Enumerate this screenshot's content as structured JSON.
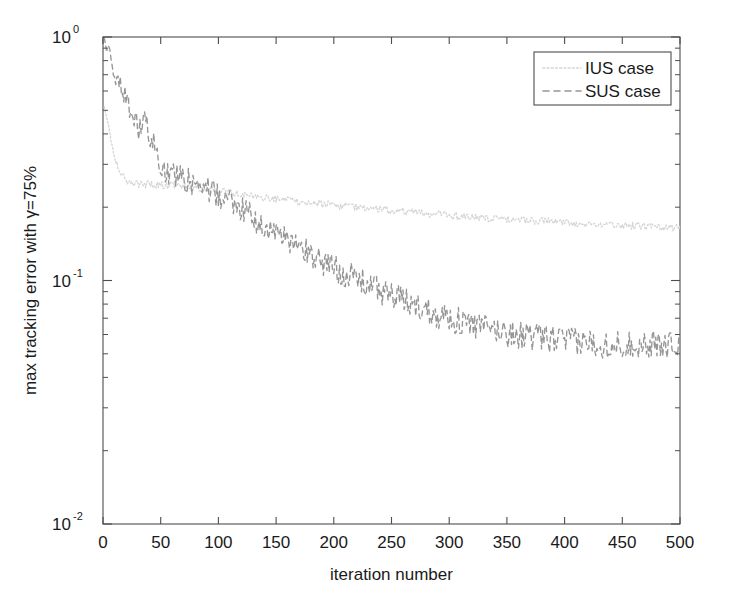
{
  "figure": {
    "background_color": "#ffffff",
    "axes_color": "#4d4d4d",
    "text_color": "#1a1a1a"
  },
  "axes": {
    "x_title": "iteration number",
    "y_title_parts": {
      "prefix": "max tracking error with ",
      "gamma": "γ",
      "suffix": "=75%"
    },
    "y_title_full": "max tracking error with γ=75%",
    "x_ticks": [
      "0",
      "50",
      "100",
      "150",
      "200",
      "250",
      "300",
      "350",
      "400",
      "450",
      "500"
    ],
    "x_tick_values": [
      0,
      50,
      100,
      150,
      200,
      250,
      300,
      350,
      400,
      450,
      500
    ],
    "y_ticks": [
      {
        "mantissa": "10",
        "exponent": "0",
        "value": 1
      },
      {
        "mantissa": "10",
        "exponent": "-1",
        "value": 0.1
      },
      {
        "mantissa": "10",
        "exponent": "-2",
        "value": 0.01
      }
    ]
  },
  "legend": {
    "position": "top-right",
    "entries": [
      {
        "label": "IUS case",
        "style": "dotted",
        "color": "#d5d5d5"
      },
      {
        "label": "SUS case",
        "style": "dashed",
        "color": "#969696"
      }
    ]
  },
  "chart_data": {
    "type": "line",
    "title": "",
    "xlabel": "iteration number",
    "ylabel": "max tracking error with γ=75%",
    "xlim": [
      0,
      500
    ],
    "ylim": [
      0.01,
      1
    ],
    "yscale": "log",
    "xscale": "linear",
    "grid": false,
    "legend_position": "upper right",
    "x": [
      1,
      6,
      11,
      16,
      21,
      26,
      31,
      36,
      41,
      46,
      51,
      56,
      61,
      66,
      71,
      76,
      81,
      86,
      91,
      96,
      101,
      106,
      111,
      116,
      121,
      126,
      131,
      136,
      141,
      146,
      151,
      156,
      161,
      166,
      171,
      176,
      181,
      186,
      191,
      196,
      201,
      206,
      211,
      216,
      221,
      226,
      231,
      236,
      241,
      246,
      251,
      256,
      261,
      266,
      271,
      276,
      281,
      286,
      291,
      296,
      301,
      306,
      311,
      316,
      321,
      326,
      331,
      336,
      341,
      346,
      351,
      356,
      361,
      366,
      371,
      376,
      381,
      386,
      391,
      396,
      401,
      406,
      411,
      416,
      421,
      426,
      431,
      436,
      441,
      446,
      451,
      456,
      461,
      466,
      471,
      476,
      481,
      486,
      491,
      496,
      500
    ],
    "series": [
      {
        "name": "IUS case",
        "style": "dotted",
        "color": "#d5d5d5",
        "values": [
          0.52,
          0.4,
          0.31,
          0.27,
          0.255,
          0.252,
          0.25,
          0.249,
          0.248,
          0.248,
          0.247,
          0.246,
          0.246,
          0.245,
          0.244,
          0.243,
          0.242,
          0.24,
          0.238,
          0.236,
          0.234,
          0.231,
          0.229,
          0.227,
          0.225,
          0.223,
          0.222,
          0.22,
          0.219,
          0.217,
          0.216,
          0.214,
          0.213,
          0.212,
          0.21,
          0.209,
          0.208,
          0.207,
          0.206,
          0.205,
          0.204,
          0.203,
          0.202,
          0.201,
          0.2,
          0.199,
          0.198,
          0.197,
          0.196,
          0.195,
          0.194,
          0.193,
          0.192,
          0.191,
          0.19,
          0.189,
          0.188,
          0.188,
          0.187,
          0.186,
          0.185,
          0.184,
          0.184,
          0.183,
          0.182,
          0.182,
          0.181,
          0.18,
          0.18,
          0.179,
          0.178,
          0.178,
          0.177,
          0.177,
          0.176,
          0.176,
          0.175,
          0.175,
          0.174,
          0.174,
          0.173,
          0.173,
          0.172,
          0.172,
          0.171,
          0.171,
          0.17,
          0.17,
          0.17,
          0.169,
          0.169,
          0.168,
          0.168,
          0.168,
          0.167,
          0.167,
          0.166,
          0.166,
          0.166,
          0.165,
          0.165
        ],
        "noise_amplitude": 0.035
      },
      {
        "name": "SUS case",
        "style": "dashed",
        "color": "#969696",
        "values": [
          0.98,
          0.8,
          0.68,
          0.62,
          0.55,
          0.46,
          0.42,
          0.44,
          0.4,
          0.34,
          0.3,
          0.285,
          0.275,
          0.268,
          0.262,
          0.255,
          0.25,
          0.243,
          0.237,
          0.23,
          0.222,
          0.215,
          0.208,
          0.201,
          0.194,
          0.187,
          0.18,
          0.173,
          0.167,
          0.161,
          0.155,
          0.15,
          0.145,
          0.14,
          0.136,
          0.132,
          0.128,
          0.124,
          0.12,
          0.117,
          0.113,
          0.11,
          0.107,
          0.104,
          0.101,
          0.099,
          0.096,
          0.094,
          0.091,
          0.089,
          0.087,
          0.085,
          0.083,
          0.081,
          0.079,
          0.078,
          0.076,
          0.075,
          0.073,
          0.072,
          0.07,
          0.069,
          0.068,
          0.067,
          0.066,
          0.065,
          0.064,
          0.063,
          0.063,
          0.062,
          0.061,
          0.061,
          0.06,
          0.06,
          0.059,
          0.059,
          0.058,
          0.058,
          0.058,
          0.057,
          0.057,
          0.057,
          0.056,
          0.056,
          0.056,
          0.056,
          0.055,
          0.055,
          0.055,
          0.055,
          0.055,
          0.055,
          0.055,
          0.055,
          0.055,
          0.055,
          0.055,
          0.055,
          0.055,
          0.055,
          0.055
        ],
        "noise_amplitude": 0.13
      }
    ]
  }
}
